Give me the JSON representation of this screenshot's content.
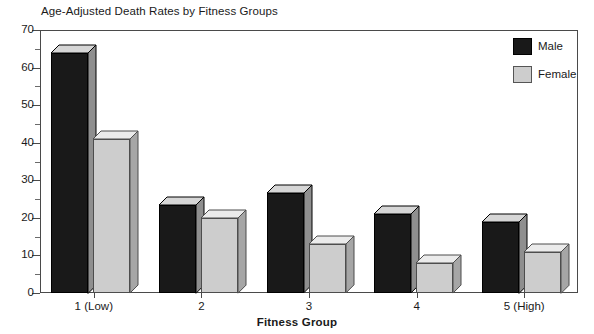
{
  "chart_data": {
    "type": "bar",
    "title": "Age-Adjusted Death Rates by Fitness Groups",
    "xlabel": "Fitness Group",
    "ylabel": "",
    "categories": [
      "1 (Low)",
      "2",
      "3",
      "4",
      "5 (High)"
    ],
    "series": [
      {
        "name": "Male",
        "color": "#191919",
        "values": [
          64,
          23.5,
          26.5,
          21,
          19
        ]
      },
      {
        "name": "Female",
        "color": "#cdcdcd",
        "values": [
          41,
          20,
          13,
          8,
          11
        ]
      }
    ],
    "ylim": [
      0,
      70
    ],
    "y_major_ticks": [
      0,
      10,
      20,
      30,
      40,
      50,
      60,
      70
    ],
    "y_minor_ticks": [
      5,
      15,
      25,
      35,
      45,
      55,
      65
    ],
    "y_tick_labels": [
      "0",
      "10",
      "20",
      "30",
      "40",
      "50",
      "60",
      "70"
    ],
    "grid": false,
    "legend_position": "top-right",
    "bar_style": "3d"
  },
  "legend": {
    "entries": [
      {
        "label": "Male"
      },
      {
        "label": "Female"
      }
    ]
  }
}
